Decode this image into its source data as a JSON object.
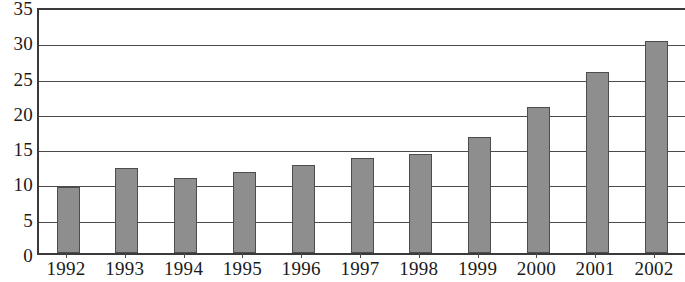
{
  "chart_data": {
    "type": "bar",
    "title": "",
    "subtitle": "",
    "xlabel": "",
    "ylabel": "",
    "categories": [
      "1992",
      "1993",
      "1994",
      "1995",
      "1996",
      "1997",
      "1998",
      "1999",
      "2000",
      "2001",
      "2002"
    ],
    "values": [
      9.3,
      12.0,
      10.7,
      11.5,
      12.5,
      13.4,
      14.0,
      16.4,
      20.7,
      25.6,
      30.0
    ],
    "ylim": [
      0,
      35
    ],
    "y_ticks": [
      0,
      5,
      10,
      15,
      20,
      25,
      30,
      35
    ],
    "y_tick_labels": [
      "0",
      "5",
      "10",
      "15",
      "20",
      "25",
      "30",
      "35"
    ],
    "grid": true,
    "grid_axis": "y",
    "legend": false,
    "legend_position": "none",
    "annotations": [],
    "colors": {
      "bar_fill": "#8e8e8e",
      "bar_border": "#4d4d4d",
      "gridline": "#4a4a4a",
      "axis": "#3a3a3a",
      "text": "#1a1a1a",
      "background": "#ffffff"
    }
  }
}
